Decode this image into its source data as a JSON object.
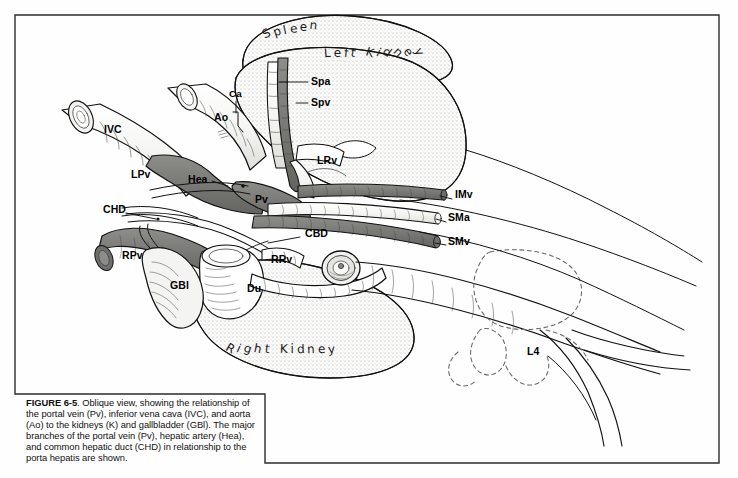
{
  "figure": {
    "number": "6-5",
    "caption_lead": "FIGURE 6-5",
    "caption_body": ". Oblique view, showing the relationship of the portal vein (Pv), inferior vena cava (IVC), and aorta (Ao) to the kidneys (K) and gallbladder (GBl). The major branches of the portal vein (Pv), hepatic artery (Hea), and common hepatic duct (CHD) in relationship to the porta hepatis are shown."
  },
  "colors": {
    "ink": "#000000",
    "vein_fill": "#7b7b79",
    "stipple": "#b9b9b5",
    "paper": "#fefefe",
    "frame": "#2b2b2b"
  },
  "organ_labels": [
    {
      "id": "spleen",
      "text": "Spleen",
      "x": 258,
      "y": 24,
      "rotate": -12,
      "arc": 26,
      "size": 13
    },
    {
      "id": "left-kidney",
      "text": "Left Kidney",
      "x": 318,
      "y": 48,
      "rotate": 8,
      "arc": 34,
      "size": 13
    },
    {
      "id": "right-kidney",
      "text": "Right Kidney",
      "x": 222,
      "y": 352,
      "rotate": 14,
      "arc": 26,
      "size": 13
    }
  ],
  "vessel_labels": [
    {
      "id": "ivc",
      "text": "IVC",
      "x": 104,
      "y": 124
    },
    {
      "id": "ao",
      "text": "Ao",
      "x": 214,
      "y": 112
    },
    {
      "id": "ca",
      "text": "Ca",
      "x": 229,
      "y": 98
    },
    {
      "id": "spa",
      "text": "Spa",
      "x": 313,
      "y": 79
    },
    {
      "id": "spv",
      "text": "Spv",
      "x": 313,
      "y": 100
    },
    {
      "id": "lpv",
      "text": "LPv",
      "x": 131,
      "y": 174
    },
    {
      "id": "hea",
      "text": "Hea",
      "x": 190,
      "y": 177
    },
    {
      "id": "lrv",
      "text": "LRv",
      "x": 318,
      "y": 160
    },
    {
      "id": "pv",
      "text": "Pv",
      "x": 256,
      "y": 198
    },
    {
      "id": "imv",
      "text": "IMv",
      "x": 456,
      "y": 196
    },
    {
      "id": "sma",
      "text": "SMa",
      "x": 449,
      "y": 218
    },
    {
      "id": "smv",
      "text": "SMv",
      "x": 449,
      "y": 241
    },
    {
      "id": "chd",
      "text": "CHD",
      "x": 104,
      "y": 209
    },
    {
      "id": "cbd",
      "text": "CBD",
      "x": 306,
      "y": 233
    },
    {
      "id": "rpv",
      "text": "RPv",
      "x": 123,
      "y": 255
    },
    {
      "id": "rrv",
      "text": "RRv",
      "x": 272,
      "y": 259
    },
    {
      "id": "gbl",
      "text": "GBl",
      "x": 172,
      "y": 285
    },
    {
      "id": "du",
      "text": "Du",
      "x": 248,
      "y": 288
    },
    {
      "id": "l4",
      "text": "L4",
      "x": 528,
      "y": 351
    }
  ]
}
